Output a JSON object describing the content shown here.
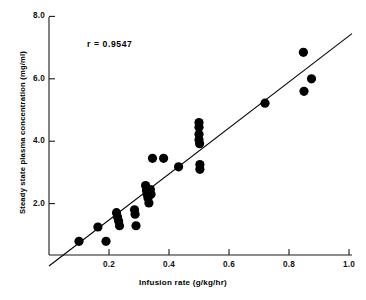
{
  "chart_data": {
    "type": "scatter",
    "title": "",
    "xlabel": "Infusion rate (g/kg/hr)",
    "ylabel": "Steady state plasma concentration (mg/ml)",
    "xlim": [
      0,
      1.0
    ],
    "ylim": [
      0,
      8.0
    ],
    "xticks": [
      0.2,
      0.4,
      0.6,
      0.8,
      1.0
    ],
    "xtick_labels": [
      "0.2",
      "0.4",
      "0.6",
      "0.8",
      "1.0"
    ],
    "yticks": [
      2.0,
      4.0,
      6.0,
      8.0
    ],
    "ytick_labels": [
      "2.0",
      "4.0",
      "6.0",
      "8.0"
    ],
    "grid": false,
    "legend": "none",
    "annotations": [
      {
        "name": "correlation-coefficient",
        "text": "r  =  0.9547",
        "x": 0.13,
        "y": 7.25
      }
    ],
    "marker": {
      "shape": "circle",
      "color": "#000000",
      "size": 5.4
    },
    "series": [
      {
        "name": "Subjects",
        "marker_color": "#000000",
        "points": [
          {
            "x": 0.1,
            "y": 0.79
          },
          {
            "x": 0.163,
            "y": 1.25
          },
          {
            "x": 0.19,
            "y": 0.79
          },
          {
            "x": 0.225,
            "y": 1.71
          },
          {
            "x": 0.228,
            "y": 1.58
          },
          {
            "x": 0.232,
            "y": 1.44
          },
          {
            "x": 0.235,
            "y": 1.29
          },
          {
            "x": 0.285,
            "y": 1.8
          },
          {
            "x": 0.287,
            "y": 1.66
          },
          {
            "x": 0.29,
            "y": 1.29
          },
          {
            "x": 0.322,
            "y": 2.58
          },
          {
            "x": 0.325,
            "y": 2.42
          },
          {
            "x": 0.327,
            "y": 2.3
          },
          {
            "x": 0.33,
            "y": 2.18
          },
          {
            "x": 0.333,
            "y": 2.02
          },
          {
            "x": 0.338,
            "y": 2.45
          },
          {
            "x": 0.34,
            "y": 2.3
          },
          {
            "x": 0.345,
            "y": 3.45
          },
          {
            "x": 0.382,
            "y": 3.45
          },
          {
            "x": 0.432,
            "y": 3.18
          },
          {
            "x": 0.5,
            "y": 4.6
          },
          {
            "x": 0.5,
            "y": 4.45
          },
          {
            "x": 0.5,
            "y": 4.22
          },
          {
            "x": 0.5,
            "y": 4.05
          },
          {
            "x": 0.502,
            "y": 3.92
          },
          {
            "x": 0.503,
            "y": 3.25
          },
          {
            "x": 0.503,
            "y": 3.1
          },
          {
            "x": 0.72,
            "y": 5.22
          },
          {
            "x": 0.848,
            "y": 6.85
          },
          {
            "x": 0.85,
            "y": 5.6
          },
          {
            "x": 0.875,
            "y": 6.0
          }
        ]
      }
    ],
    "trendline": {
      "name": "regression-line",
      "x_start": 0.0,
      "y_start": 0.0,
      "x_end": 1.01,
      "y_end": 7.45,
      "color": "#000000"
    }
  }
}
